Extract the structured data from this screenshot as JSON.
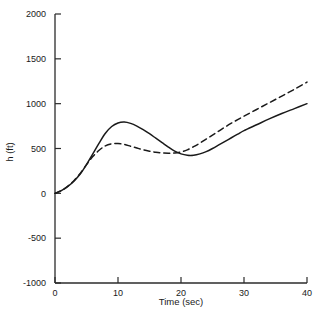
{
  "chart_data": {
    "type": "line",
    "title": "",
    "xlabel": "Time (sec)",
    "ylabel": "h (ft)",
    "xlim": [
      0,
      40
    ],
    "ylim": [
      -1000,
      2000
    ],
    "grid": false,
    "legend": "none",
    "xticks": [
      0,
      10,
      20,
      30,
      40
    ],
    "xtick_labels": [
      "0",
      "10",
      "20",
      "30",
      "40"
    ],
    "yticks": [
      -1000,
      -500,
      0,
      500,
      1000,
      1500,
      2000
    ],
    "ytick_labels": [
      "-1000",
      "-500",
      "0",
      "500",
      "1000",
      "1500",
      "2000"
    ],
    "series": [
      {
        "name": "solid",
        "style": "solid",
        "color": "#1a1a1a",
        "x": [
          0,
          1,
          2,
          3,
          4,
          5,
          6,
          7,
          8,
          9,
          10,
          11,
          12,
          13,
          14,
          15,
          16,
          17,
          18,
          19,
          20,
          21,
          22,
          23,
          24,
          25,
          26,
          27,
          28,
          29,
          30,
          32,
          34,
          36,
          38,
          40
        ],
        "y": [
          0,
          30,
          75,
          135,
          215,
          320,
          440,
          560,
          670,
          745,
          785,
          795,
          780,
          750,
          710,
          665,
          615,
          565,
          515,
          470,
          440,
          425,
          425,
          440,
          465,
          500,
          540,
          580,
          620,
          660,
          700,
          765,
          830,
          890,
          945,
          1000
        ]
      },
      {
        "name": "dashed",
        "style": "dashed",
        "color": "#1a1a1a",
        "x": [
          0,
          1,
          2,
          3,
          4,
          5,
          6,
          7,
          8,
          9,
          10,
          11,
          12,
          13,
          14,
          15,
          16,
          17,
          18,
          19,
          20,
          21,
          22,
          23,
          24,
          25,
          26,
          27,
          28,
          29,
          30,
          32,
          34,
          36,
          38,
          40
        ],
        "y": [
          0,
          30,
          78,
          140,
          222,
          320,
          410,
          480,
          530,
          552,
          555,
          545,
          525,
          505,
          485,
          470,
          458,
          450,
          447,
          450,
          462,
          485,
          520,
          560,
          605,
          650,
          695,
          740,
          782,
          822,
          860,
          935,
          1010,
          1085,
          1160,
          1240
        ]
      }
    ]
  }
}
